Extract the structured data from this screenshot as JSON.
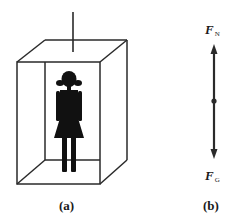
{
  "figure": {
    "panel_a": {
      "caption": "(a)",
      "description": "person standing in elevator cabin suspended by cable"
    },
    "panel_b": {
      "caption": "(b)",
      "forces": [
        {
          "symbol": "F",
          "subscript": "N",
          "direction": "up"
        },
        {
          "symbol": "F",
          "subscript": "G",
          "direction": "down"
        }
      ]
    }
  },
  "colors": {
    "line": "#2a2a2a",
    "figure": "#111111",
    "background": "#ffffff"
  }
}
